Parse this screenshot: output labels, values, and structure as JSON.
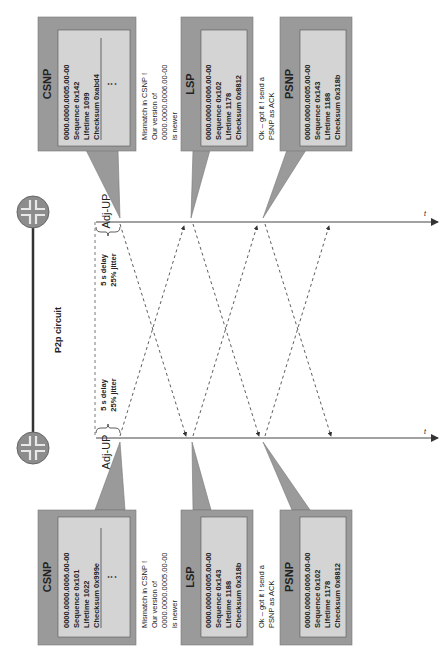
{
  "link": {
    "label": "P2p circuit"
  },
  "routers": [
    {
      "name": "router-top",
      "icon": "router-icon"
    },
    {
      "name": "router-bottom",
      "icon": "router-icon"
    }
  ],
  "timelines": [
    {
      "side": "top",
      "adj_label": "Adj-UP",
      "axis_label": "t",
      "delay_label_1": "5 s delay",
      "delay_label_2": "25% jitter"
    },
    {
      "side": "bottom",
      "adj_label": "Adj-UP",
      "axis_label": "t",
      "delay_label_1": "5 s delay",
      "delay_label_2": "25% jitter"
    }
  ],
  "top_callouts": [
    {
      "title": "CSNP",
      "lines": [
        "0000.0000.0005.00-00",
        "Sequence 0x142",
        "Lifetime 1099",
        "Checksum 0xabd4"
      ],
      "ellipsis": "⋮"
    },
    {
      "title": "LSP",
      "lines": [
        "0000.0000.0006.00-00",
        "Sequence  0x102",
        "Lifetime   1178",
        "Checksum 0x8812"
      ]
    },
    {
      "title": "PSNP",
      "lines": [
        "0000.0000.0005.00-00",
        "Sequence 0x143",
        "Lifetime 1188",
        "Checksum 0x318b"
      ]
    }
  ],
  "bottom_callouts": [
    {
      "title": "CSNP",
      "lines": [
        "0000.0000.0006.00-00",
        "Sequence 0x101",
        "Lifetime 1022",
        "Checksum 0x999e"
      ],
      "ellipsis": "⋮"
    },
    {
      "title": "LSP",
      "lines": [
        "0000.0000.0005.00-00",
        "Sequence 0x143",
        "Lifetime 1188",
        "Checksum 0x318b"
      ]
    },
    {
      "title": "PSNP",
      "lines": [
        "0000.0000.0006.00-00",
        "Sequence 0x102",
        "Lifetime 1178",
        "Checksum 0x8812"
      ]
    }
  ],
  "top_notes": [
    [
      "Mismatch in CSNP !",
      "Our version of",
      "0000.0000.0006.00-00",
      "is newer"
    ],
    [
      "Ok – got it ! send a",
      "PSNP as ACK"
    ]
  ],
  "bottom_notes": [
    [
      "Mismatch in CSNP !",
      "Our version of",
      "0000.0000.0005.00-00",
      "is newer"
    ],
    [
      "Ok – got it ! send a",
      "PSNP as ACK"
    ]
  ],
  "colors": {
    "callout_outer": "#9a9a9a",
    "callout_inner": "#d4d4d4",
    "router_fill": "#8c8c8c",
    "line": "#333333"
  }
}
